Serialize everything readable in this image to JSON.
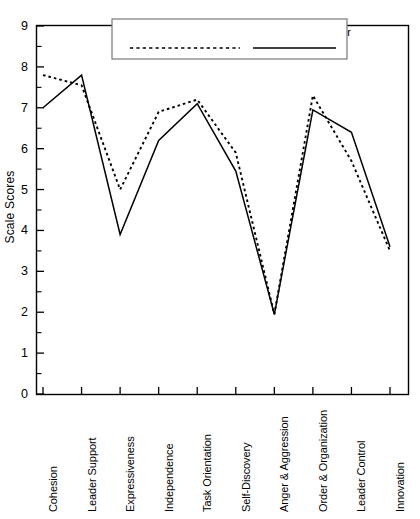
{
  "chart_data": {
    "type": "line",
    "title": "",
    "xlabel": "",
    "ylabel": "Scale Scores",
    "ylim": [
      0,
      9
    ],
    "yticks": [
      0,
      1,
      2,
      3,
      4,
      5,
      6,
      7,
      8,
      9
    ],
    "minor_ticks": true,
    "grid": false,
    "legend_position": "top-center",
    "categories": [
      "Cohesion",
      "Leader Support",
      "Expressiveness",
      "Independence",
      "Task Orientation",
      "Self-Discovery",
      "Anger & Aggression",
      "Order & Organization",
      "Leader Control",
      "Innovation"
    ],
    "series": [
      {
        "name": "Indigenous Leader",
        "style": "dotted",
        "color": "#000000",
        "values": [
          7.8,
          7.55,
          5.0,
          6.9,
          7.2,
          5.9,
          1.95,
          7.3,
          5.7,
          3.5
        ]
      },
      {
        "name": "Professional Leader",
        "style": "solid",
        "color": "#000000",
        "values": [
          7.0,
          7.8,
          3.9,
          6.2,
          7.1,
          5.45,
          1.95,
          6.95,
          6.4,
          3.6
        ]
      }
    ]
  },
  "axis": {
    "y_label": "Scale Scores",
    "y_tick_labels": [
      "9",
      "8",
      "7",
      "6",
      "5",
      "4",
      "3",
      "2",
      "1",
      "0"
    ]
  },
  "legend": {
    "items": [
      {
        "label": "Indigenous Leader",
        "style": "dotted"
      },
      {
        "label": "Professional Leader",
        "style": "solid"
      }
    ]
  },
  "colors": {
    "line": "#000000",
    "axis": "#000000",
    "legend_border": "#666666",
    "background": "#ffffff"
  }
}
